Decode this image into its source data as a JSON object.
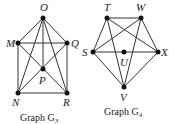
{
  "graphs": [
    {
      "caption": "Graph G",
      "caption_sub": "3",
      "vertices": [
        {
          "id": "O",
          "x": 43,
          "y": 18
        },
        {
          "id": "M",
          "x": 18,
          "y": 43
        },
        {
          "id": "Q",
          "x": 67,
          "y": 43
        },
        {
          "id": "P",
          "x": 43,
          "y": 69
        },
        {
          "id": "N",
          "x": 18,
          "y": 93
        },
        {
          "id": "R",
          "x": 67,
          "y": 93
        }
      ],
      "edges": [
        [
          "O",
          "M"
        ],
        [
          "O",
          "Q"
        ],
        [
          "O",
          "N"
        ],
        [
          "O",
          "R"
        ],
        [
          "O",
          "P"
        ],
        [
          "M",
          "Q"
        ],
        [
          "M",
          "N"
        ],
        [
          "Q",
          "R"
        ],
        [
          "N",
          "R"
        ],
        [
          "M",
          "P"
        ],
        [
          "P",
          "R"
        ],
        [
          "Q",
          "P"
        ],
        [
          "P",
          "N"
        ]
      ]
    },
    {
      "caption": "Graph G",
      "caption_sub": "4",
      "vertices": [
        {
          "id": "T",
          "x": 107,
          "y": 18
        },
        {
          "id": "W",
          "x": 141,
          "y": 18
        },
        {
          "id": "S",
          "x": 93,
          "y": 52
        },
        {
          "id": "U",
          "x": 124,
          "y": 52
        },
        {
          "id": "X",
          "x": 158,
          "y": 52
        },
        {
          "id": "V",
          "x": 124,
          "y": 87
        }
      ],
      "edges": [
        [
          "T",
          "W"
        ],
        [
          "T",
          "S"
        ],
        [
          "T",
          "X"
        ],
        [
          "T",
          "V"
        ],
        [
          "W",
          "S"
        ],
        [
          "W",
          "X"
        ],
        [
          "W",
          "V"
        ],
        [
          "S",
          "U"
        ],
        [
          "U",
          "X"
        ],
        [
          "S",
          "V"
        ],
        [
          "X",
          "V"
        ]
      ]
    }
  ]
}
